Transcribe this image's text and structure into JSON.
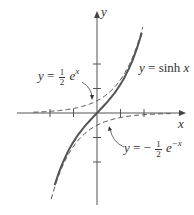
{
  "chart_data": {
    "type": "line",
    "title": "",
    "xlabel": "x",
    "ylabel": "y",
    "xlim": [
      -4,
      4
    ],
    "ylim": [
      -4,
      4
    ],
    "grid": false,
    "x_ticks": [
      -2,
      -1,
      1,
      2
    ],
    "y_ticks": [
      -2,
      -1,
      1,
      2
    ],
    "series": [
      {
        "name": "y = sinh x",
        "style": "solid",
        "x": [
          -2,
          -1.5,
          -1,
          -0.5,
          0,
          0.5,
          1,
          1.5,
          2
        ],
        "values": [
          -3.63,
          -2.13,
          -1.18,
          -0.52,
          0,
          0.52,
          1.18,
          2.13,
          3.63
        ]
      },
      {
        "name": "y = 1/2 e^x",
        "style": "dashed",
        "x": [
          -3,
          -2,
          -1,
          0,
          1,
          1.5,
          2
        ],
        "values": [
          0.02,
          0.07,
          0.18,
          0.5,
          1.36,
          2.24,
          3.69
        ]
      },
      {
        "name": "y = -1/2 e^-x",
        "style": "dashed",
        "x": [
          -2,
          -1.5,
          -1,
          0,
          1,
          2,
          3
        ],
        "values": [
          -3.69,
          -2.24,
          -1.36,
          -0.5,
          -0.18,
          -0.07,
          -0.02
        ]
      }
    ],
    "annotations": [
      {
        "text": "y = sinh x",
        "near": "upper right of sinh curve"
      },
      {
        "text": "y = 1/2 e^x",
        "arrow_to": "dashed curve near (0, 0.5)"
      },
      {
        "text": "y = -1/2 e^-x",
        "arrow_to": "dashed curve near (0.5, -0.3)"
      }
    ]
  },
  "labels": {
    "x_axis": "x",
    "y_axis": "y",
    "sinh_y": "y",
    "sinh_eq": "=",
    "sinh_fn": "sinh",
    "sinh_x": "x",
    "exp_y": "y",
    "exp_eq": "=",
    "exp_num": "1",
    "exp_den": "2",
    "exp_e": "e",
    "exp_power": "x",
    "nexp_y": "y",
    "nexp_eq": "= −",
    "nexp_num": "1",
    "nexp_den": "2",
    "nexp_e": "e",
    "nexp_power": "−x"
  }
}
